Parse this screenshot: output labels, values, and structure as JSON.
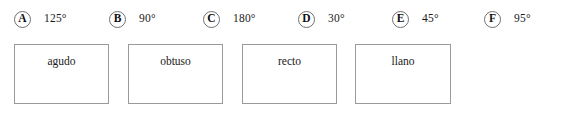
{
  "exercise": {
    "options": [
      {
        "marker": "A",
        "value": "125°",
        "left": 14
      },
      {
        "marker": "B",
        "value": "90°",
        "left": 109
      },
      {
        "marker": "C",
        "value": "180°",
        "left": 203
      },
      {
        "marker": "D",
        "value": "30°",
        "left": 298
      },
      {
        "marker": "E",
        "value": "45°",
        "left": 392
      },
      {
        "marker": "F",
        "value": "95°",
        "left": 484
      }
    ],
    "drop_boxes": [
      {
        "label": "agudo",
        "left": 14,
        "width": 95
      },
      {
        "label": "obtuso",
        "left": 128,
        "width": 95
      },
      {
        "label": "recto",
        "left": 242,
        "width": 95
      },
      {
        "label": "llano",
        "left": 355,
        "width": 96
      }
    ],
    "colors": {
      "background": "#ffffff",
      "text": "#1a1a1a",
      "marker_border": "#6f6f6f",
      "box_border": "#9a9a9a"
    }
  }
}
